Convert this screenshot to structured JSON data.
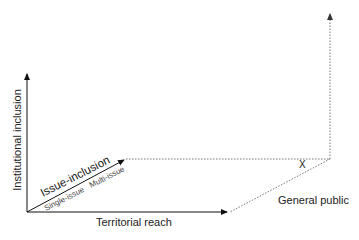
{
  "diagram": {
    "axes": {
      "vertical": {
        "label": "Institutional inclusion"
      },
      "horizontal": {
        "label": "Territorial reach"
      },
      "diagonal": {
        "label": "Issue-inclusion",
        "start_label": "Single-issue",
        "end_label": "Multi-issue"
      }
    },
    "annotations": {
      "general_public": "General public",
      "marker": "X"
    },
    "colors": {
      "solid_line": "#111111",
      "dotted_line": "#777777"
    }
  }
}
